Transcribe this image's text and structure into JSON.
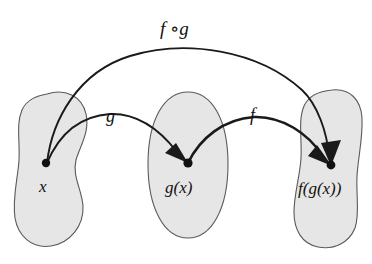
{
  "figure": {
    "kind": "function-composition-diagram",
    "background_color": "#ffffff",
    "ink_color": "#1a1a1a",
    "blob_fill_color": "#e6e6e6",
    "blob_stroke_color": "#5a5a5a"
  },
  "sets": [
    {
      "id": "domain-set",
      "point_label": "x",
      "point_x": 46,
      "point_y": 163,
      "label_x": 39,
      "label_y": 192
    },
    {
      "id": "intermediate-set",
      "point_label": "g(x)",
      "point_x": 188,
      "point_y": 163,
      "label_x": 165,
      "label_y": 193
    },
    {
      "id": "codomain-set",
      "point_label": "f(g(x))",
      "point_x": 331,
      "point_y": 165,
      "label_x": 298,
      "label_y": 194
    }
  ],
  "arrows": [
    {
      "id": "arrow-g",
      "label": "g",
      "label_x": 106,
      "label_y": 122,
      "from": "x",
      "to": "g(x)"
    },
    {
      "id": "arrow-f",
      "label": "f",
      "label_x": 250,
      "label_y": 121,
      "from": "g(x)",
      "to": "f(g(x))"
    },
    {
      "id": "arrow-f-compose-g",
      "label": "f ∘g",
      "label_x": 160,
      "label_y": 35,
      "from": "x",
      "to": "f(g(x))"
    }
  ]
}
